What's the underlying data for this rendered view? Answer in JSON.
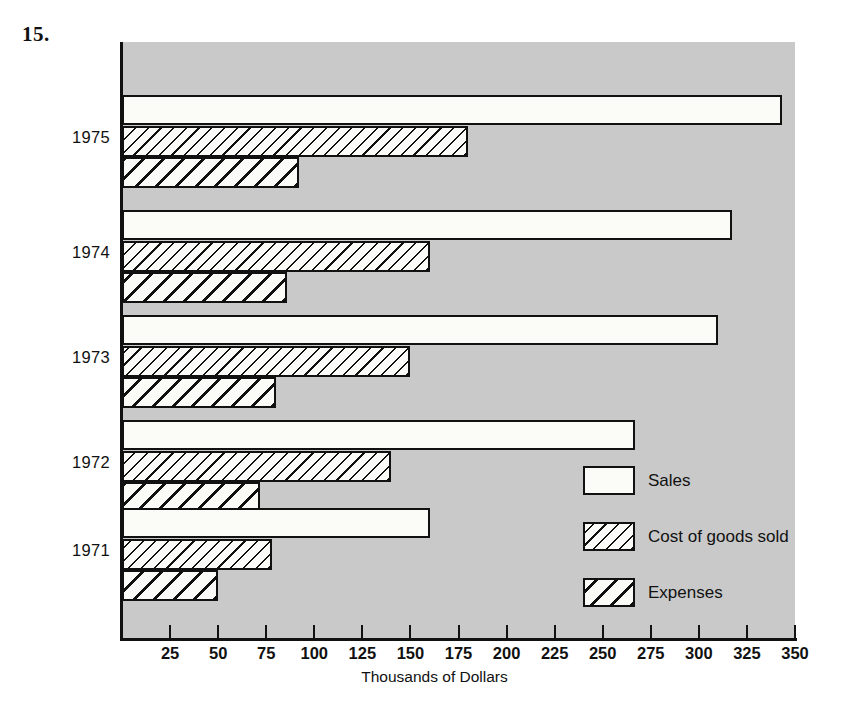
{
  "problem": {
    "number": "15."
  },
  "chart_data": {
    "type": "bar",
    "orientation": "horizontal",
    "title": "",
    "xlabel": "Thousands of Dollars",
    "ylabel": "",
    "categories": [
      "1975",
      "1974",
      "1973",
      "1972",
      "1971"
    ],
    "series": [
      {
        "name": "Sales",
        "values": [
          343,
          317,
          310,
          267,
          160
        ]
      },
      {
        "name": "Cost of goods sold",
        "values": [
          180,
          160,
          150,
          140,
          78
        ]
      },
      {
        "name": "Expenses",
        "values": [
          92,
          86,
          80,
          72,
          50
        ]
      }
    ],
    "xlim": [
      0,
      350
    ],
    "xticks": [
      25,
      50,
      75,
      100,
      125,
      150,
      175,
      200,
      225,
      250,
      275,
      300,
      325,
      350
    ],
    "xtick_labels": [
      "25",
      "50",
      "75",
      "100",
      "125",
      "150",
      "175",
      "200",
      "225",
      "250",
      "275",
      "300",
      "325",
      "350"
    ],
    "grid": false,
    "legend_position": "inside-bottom-right",
    "plot_background": "#c9c9c9",
    "bar_fill": "#fbfbf8",
    "bar_outline": "#111111"
  },
  "legend": {
    "items": [
      {
        "label": "Sales",
        "pattern": "solid-white"
      },
      {
        "label": "Cost of goods sold",
        "pattern": "thin-diagonal-hatch"
      },
      {
        "label": "Expenses",
        "pattern": "thick-diagonal-hatch"
      }
    ]
  },
  "axis": {
    "x_title": "Thousands of Dollars"
  }
}
